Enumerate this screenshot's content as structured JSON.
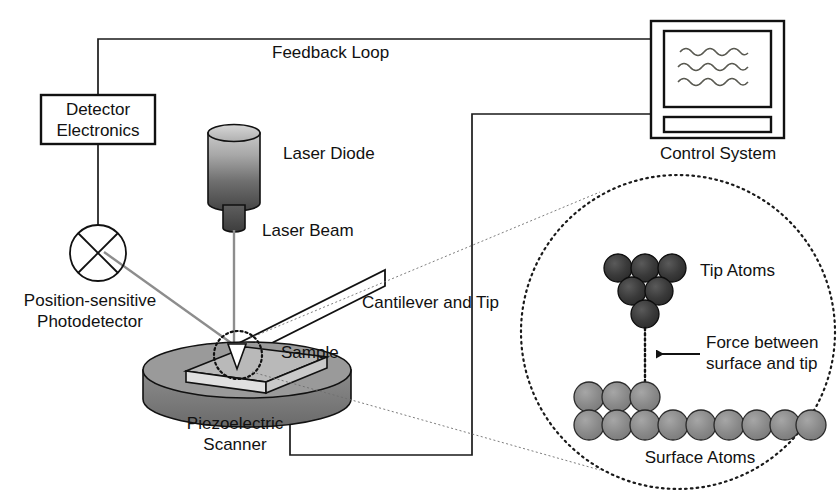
{
  "diagram": {
    "labels": {
      "feedback_loop": "Feedback Loop",
      "detector_electronics_line1": "Detector",
      "detector_electronics_line2": "Electronics",
      "laser_diode": "Laser Diode",
      "laser_beam": "Laser Beam",
      "photodetector_line1": "Position-sensitive",
      "photodetector_line2": "Photodetector",
      "cantilever_and_tip": "Cantilever and Tip",
      "sample": "Sample",
      "piezo_line1": "Piezoelectric",
      "piezo_line2": "Scanner",
      "control_system": "Control System",
      "tip_atoms": "Tip Atoms",
      "surface_atoms": "Surface Atoms",
      "force_line1": "Force between",
      "force_line2": "surface and tip"
    },
    "colors": {
      "ink": "#111111",
      "beam_gray": "#8d8d8d",
      "scanner_body": "#7d7d7d",
      "scanner_top": "#9a9a9a",
      "sample_top": "#b4b4b4",
      "sample_side": "#d8d8d8",
      "tip_atom": "#3a3a3a",
      "surface_atom": "#878787",
      "diode_top": "#bdbdbd",
      "diode_bottom": "#4a4a4a",
      "screen_wave": "#5a5a52",
      "background": "#ffffff"
    },
    "atoms": {
      "tip_rows": [
        3,
        2,
        1
      ],
      "tip_count": 6,
      "surface_upper_row_count": 3,
      "surface_lower_row_count": 9,
      "surface_count": 12,
      "atom_radius_tip": 13,
      "atom_radius_surface": 14
    },
    "monitor": {
      "wave_line_count": 3,
      "waves_per_line": 4
    },
    "components": [
      "Detector Electronics",
      "Position-sensitive Photodetector",
      "Laser Diode",
      "Cantilever and Tip",
      "Sample",
      "Piezoelectric Scanner",
      "Control System"
    ],
    "connections": [
      "Photodetector to Detector Electronics",
      "Detector Electronics to Control System (Feedback Loop)",
      "Control System to Piezoelectric Scanner",
      "Laser Diode to Cantilever (Laser Beam)",
      "Cantilever to Photodetector (reflected beam)"
    ]
  }
}
